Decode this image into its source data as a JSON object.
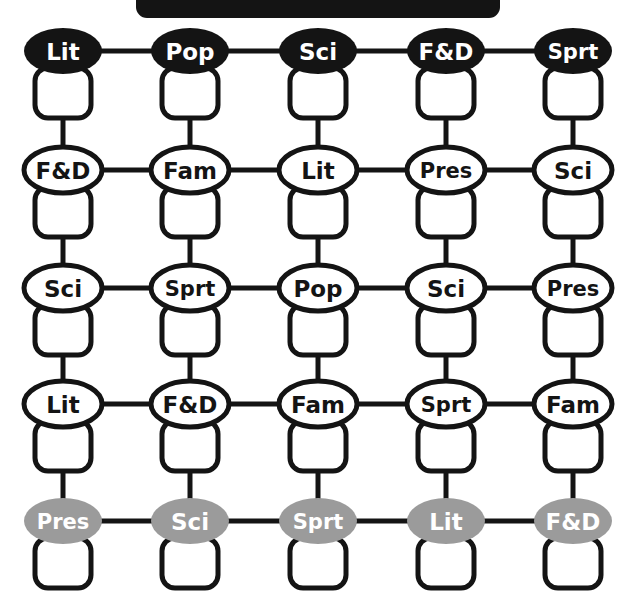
{
  "diagram": {
    "type": "grid-network",
    "title_bar": {
      "name": "header-bar",
      "shape": "rounded-rectangle",
      "fill": "#141414",
      "x": 136,
      "y": -16,
      "width": 364,
      "height": 34,
      "radius": 11,
      "label": ""
    },
    "colors": {
      "black": "#141414",
      "white": "#ffffff",
      "gray": "#9b9b9b",
      "outline": "#141414",
      "background": "#ffffff",
      "white_text": "#ffffff",
      "black_text": "#141414"
    },
    "geometry": {
      "columns_x": [
        63,
        190,
        318,
        446,
        573
      ],
      "rows_y": [
        51,
        170,
        288,
        404,
        521
      ],
      "ellipse_rx": 39,
      "ellipse_ry": 23,
      "box_width": 56,
      "box_height": 50,
      "box_radius": 13,
      "box_offset_y": 17,
      "stroke_width": 5,
      "connector_width": 5
    },
    "row_styles": [
      "filled-black",
      "outline-white",
      "outline-white",
      "outline-white",
      "filled-gray"
    ],
    "rows": [
      {
        "row_index": 0,
        "style": "filled-black",
        "fill": "#141414",
        "text_color": "#ffffff",
        "stroke": "none",
        "nodes": [
          {
            "label": "Lit",
            "col": 0
          },
          {
            "label": "Pop",
            "col": 1
          },
          {
            "label": "Sci",
            "col": 2
          },
          {
            "label": "F&D",
            "col": 3
          },
          {
            "label": "Sprt",
            "col": 4
          }
        ]
      },
      {
        "row_index": 1,
        "style": "outline-white",
        "fill": "#ffffff",
        "text_color": "#141414",
        "stroke": "#141414",
        "nodes": [
          {
            "label": "F&D",
            "col": 0
          },
          {
            "label": "Fam",
            "col": 1
          },
          {
            "label": "Lit",
            "col": 2
          },
          {
            "label": "Pres",
            "col": 3
          },
          {
            "label": "Sci",
            "col": 4
          }
        ]
      },
      {
        "row_index": 2,
        "style": "outline-white",
        "fill": "#ffffff",
        "text_color": "#141414",
        "stroke": "#141414",
        "nodes": [
          {
            "label": "Sci",
            "col": 0
          },
          {
            "label": "Sprt",
            "col": 1
          },
          {
            "label": "Pop",
            "col": 2
          },
          {
            "label": "Sci",
            "col": 3
          },
          {
            "label": "Pres",
            "col": 4
          }
        ]
      },
      {
        "row_index": 3,
        "style": "outline-white",
        "fill": "#ffffff",
        "text_color": "#141414",
        "stroke": "#141414",
        "nodes": [
          {
            "label": "Lit",
            "col": 0
          },
          {
            "label": "F&D",
            "col": 1
          },
          {
            "label": "Fam",
            "col": 2
          },
          {
            "label": "Sprt",
            "col": 3
          },
          {
            "label": "Fam",
            "col": 4
          }
        ]
      },
      {
        "row_index": 4,
        "style": "filled-gray",
        "fill": "#9b9b9b",
        "text_color": "#ffffff",
        "stroke": "none",
        "nodes": [
          {
            "label": "Pres",
            "col": 0
          },
          {
            "label": "Sci",
            "col": 1
          },
          {
            "label": "Sprt",
            "col": 2
          },
          {
            "label": "Lit",
            "col": 3
          },
          {
            "label": "F&D",
            "col": 4
          }
        ]
      }
    ],
    "horizontal_connectors": [
      {
        "row": 0,
        "from_col": 0,
        "to_col": 1
      },
      {
        "row": 0,
        "from_col": 1,
        "to_col": 2
      },
      {
        "row": 0,
        "from_col": 2,
        "to_col": 3
      },
      {
        "row": 0,
        "from_col": 3,
        "to_col": 4
      },
      {
        "row": 1,
        "from_col": 0,
        "to_col": 1
      },
      {
        "row": 1,
        "from_col": 1,
        "to_col": 2
      },
      {
        "row": 1,
        "from_col": 2,
        "to_col": 3
      },
      {
        "row": 1,
        "from_col": 3,
        "to_col": 4
      },
      {
        "row": 2,
        "from_col": 0,
        "to_col": 1
      },
      {
        "row": 2,
        "from_col": 1,
        "to_col": 2
      },
      {
        "row": 2,
        "from_col": 2,
        "to_col": 3
      },
      {
        "row": 2,
        "from_col": 3,
        "to_col": 4
      },
      {
        "row": 3,
        "from_col": 0,
        "to_col": 1
      },
      {
        "row": 3,
        "from_col": 1,
        "to_col": 2
      },
      {
        "row": 3,
        "from_col": 2,
        "to_col": 3
      },
      {
        "row": 3,
        "from_col": 3,
        "to_col": 4
      },
      {
        "row": 4,
        "from_col": 0,
        "to_col": 1
      },
      {
        "row": 4,
        "from_col": 1,
        "to_col": 2
      },
      {
        "row": 4,
        "from_col": 2,
        "to_col": 3
      },
      {
        "row": 4,
        "from_col": 3,
        "to_col": 4
      }
    ],
    "vertical_connectors": [
      {
        "col": 0,
        "from_row": 0,
        "to_row": 1
      },
      {
        "col": 0,
        "from_row": 1,
        "to_row": 2
      },
      {
        "col": 0,
        "from_row": 2,
        "to_row": 3
      },
      {
        "col": 0,
        "from_row": 3,
        "to_row": 4
      },
      {
        "col": 1,
        "from_row": 0,
        "to_row": 1
      },
      {
        "col": 1,
        "from_row": 1,
        "to_row": 2
      },
      {
        "col": 1,
        "from_row": 2,
        "to_row": 3
      },
      {
        "col": 1,
        "from_row": 3,
        "to_row": 4
      },
      {
        "col": 2,
        "from_row": 0,
        "to_row": 1
      },
      {
        "col": 2,
        "from_row": 1,
        "to_row": 2
      },
      {
        "col": 2,
        "from_row": 2,
        "to_row": 3
      },
      {
        "col": 2,
        "from_row": 3,
        "to_row": 4
      },
      {
        "col": 3,
        "from_row": 0,
        "to_row": 1
      },
      {
        "col": 3,
        "from_row": 1,
        "to_row": 2
      },
      {
        "col": 3,
        "from_row": 2,
        "to_row": 3
      },
      {
        "col": 3,
        "from_row": 3,
        "to_row": 4
      },
      {
        "col": 4,
        "from_row": 0,
        "to_row": 1
      },
      {
        "col": 4,
        "from_row": 1,
        "to_row": 2
      },
      {
        "col": 4,
        "from_row": 2,
        "to_row": 3
      },
      {
        "col": 4,
        "from_row": 3,
        "to_row": 4
      }
    ]
  }
}
